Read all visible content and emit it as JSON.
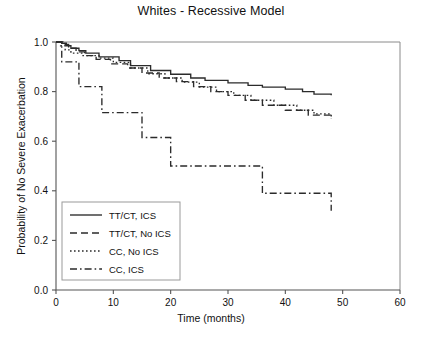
{
  "chart_data": {
    "type": "line",
    "title": "Whites - Recessive Model",
    "xlabel": "Time (months)",
    "ylabel": "Probability of No Severe Exacerbation",
    "xlim": [
      0,
      60
    ],
    "ylim": [
      0,
      1.0
    ],
    "xticks": [
      "0",
      "10",
      "20",
      "30",
      "40",
      "50",
      "60"
    ],
    "xtick_values": [
      0,
      10,
      20,
      30,
      40,
      50,
      60
    ],
    "yticks": [
      "0.0",
      "0.2",
      "0.4",
      "0.6",
      "0.8",
      "1.0"
    ],
    "ytick_values": [
      0.0,
      0.2,
      0.4,
      0.6,
      0.8,
      1.0
    ],
    "grid": false,
    "legend_position": "lower-left",
    "curve_shape": "step",
    "series": [
      {
        "name": "TT/CT, ICS",
        "dash": "none",
        "color": "#2b2b2b",
        "x": [
          0,
          1.0,
          1.8,
          2.6,
          4.0,
          5.2,
          7.5,
          11.0,
          13.0,
          16.5,
          20.0,
          23.5,
          26.0,
          30.0,
          33.5,
          36.0,
          40.0,
          43.0,
          45.0,
          48.0
        ],
        "y": [
          1.0,
          0.995,
          0.985,
          0.975,
          0.965,
          0.955,
          0.94,
          0.925,
          0.905,
          0.885,
          0.87,
          0.855,
          0.845,
          0.835,
          0.825,
          0.818,
          0.81,
          0.8,
          0.79,
          0.785
        ]
      },
      {
        "name": "TT/CT, No ICS",
        "dash": "dashed",
        "color": "#2b2b2b",
        "x": [
          0,
          1.2,
          2.2,
          3.5,
          5.0,
          7.0,
          9.5,
          12.5,
          15.0,
          18.0,
          21.0,
          24.0,
          27.0,
          30.0,
          33.0,
          36.0,
          40.0,
          44.0,
          48.0
        ],
        "y": [
          1.0,
          0.99,
          0.975,
          0.96,
          0.945,
          0.93,
          0.912,
          0.895,
          0.875,
          0.855,
          0.84,
          0.82,
          0.8,
          0.785,
          0.765,
          0.745,
          0.725,
          0.705,
          0.69
        ]
      },
      {
        "name": "CC, No ICS",
        "dash": "dotted",
        "color": "#2b2b2b",
        "x": [
          0,
          0.8,
          1.6,
          2.6,
          4.5,
          7.5,
          10.0,
          13.0,
          16.0,
          19.0,
          22.0,
          25.0,
          28.0,
          31.0,
          34.0,
          38.0,
          42.0,
          45.0,
          48.0
        ],
        "y": [
          1.0,
          0.985,
          0.968,
          0.955,
          0.945,
          0.935,
          0.918,
          0.895,
          0.872,
          0.855,
          0.838,
          0.818,
          0.8,
          0.785,
          0.765,
          0.745,
          0.725,
          0.71,
          0.7
        ]
      },
      {
        "name": "CC, ICS",
        "dash": "dashdot",
        "color": "#2b2b2b",
        "x": [
          0,
          1.0,
          4.0,
          8.0,
          15.0,
          20.0,
          36.0,
          48.0
        ],
        "y": [
          1.0,
          0.92,
          0.82,
          0.715,
          0.615,
          0.5,
          0.39,
          0.32
        ]
      }
    ],
    "legend_entries": [
      {
        "label": "TT/CT, ICS",
        "dash": "none"
      },
      {
        "label": "TT/CT, No ICS",
        "dash": "dashed"
      },
      {
        "label": "CC, No ICS",
        "dash": "dotted"
      },
      {
        "label": "CC, ICS",
        "dash": "dashdot"
      }
    ]
  }
}
